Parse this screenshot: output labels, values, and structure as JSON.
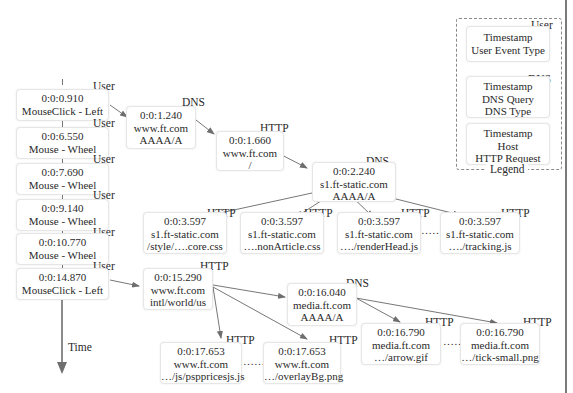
{
  "diagram": {
    "axis_label": "Time",
    "user_events": [
      {
        "tag": "User",
        "timestamp": "0:0:0.910",
        "event": "MouseClick - Left"
      },
      {
        "tag": "User",
        "timestamp": "0:0:6.550",
        "event": "Mouse - Wheel"
      },
      {
        "tag": "User",
        "timestamp": "0:0:7.690",
        "event": "Mouse - Wheel"
      },
      {
        "tag": "User",
        "timestamp": "0:0:9.140",
        "event": "Mouse - Wheel"
      },
      {
        "tag": "User",
        "timestamp": "0:0:10.770",
        "event": "Mouse - Wheel"
      },
      {
        "tag": "User",
        "timestamp": "0:0:14.870",
        "event": "MouseClick - Left"
      }
    ],
    "nodes": {
      "dns1": {
        "tag": "DNS",
        "line1": "0:0:1.240",
        "line2": "www.ft.com",
        "line3": "AAAA/A"
      },
      "http1": {
        "tag": "HTTP",
        "line1": "0:0:1.660",
        "line2": "www.ft.com",
        "line3": "/"
      },
      "dns2": {
        "tag": "DNS",
        "line1": "0:0:2.240",
        "line2": "s1.ft-static.com",
        "line3": "AAAA/A"
      },
      "http_core": {
        "tag": "HTTP",
        "line1": "0:0:3.597",
        "line2": "s1.ft-static.com",
        "line3": "/style/….core.css"
      },
      "http_nonarticle": {
        "tag": "HTTP",
        "line1": "0:0:3.597",
        "line2": "s1.ft-static.com",
        "line3": "….nonArticle.css"
      },
      "http_renderhead": {
        "tag": "HTTP",
        "line1": "0:0:3.597",
        "line2": "s1.ft-static.com",
        "line3": "…./renderHead.js"
      },
      "http_tracking": {
        "tag": "HTTP",
        "line1": "0:0:3.597",
        "line2": "s1.ft-static.com",
        "line3": "…./tracking.js"
      },
      "http_intl": {
        "tag": "HTTP",
        "line1": "0:0:15.290",
        "line2": "www.ft.com",
        "line3": "intl/world/us"
      },
      "dns_media": {
        "tag": "DNS",
        "line1": "0:0:16.040",
        "line2": "media.ft.com",
        "line3": "AAAA/A"
      },
      "http_psp": {
        "tag": "HTTP",
        "line1": "0:0:17.653",
        "line2": "www.ft.com",
        "line3": "…/js/psppricesjs.js"
      },
      "http_overlay": {
        "tag": "HTTP",
        "line1": "0:0:17.653",
        "line2": "www.ft.com",
        "line3": "…/overlayBg.png"
      },
      "http_arrow": {
        "tag": "HTTP",
        "line1": "0:0:16.790",
        "line2": "media.ft.com",
        "line3": "…/arrow.gif"
      },
      "http_tick": {
        "tag": "HTTP",
        "line1": "0:0:16.790",
        "line2": "media.ft.com",
        "line3": "…/tick-small.png"
      }
    },
    "ellipsis": "……",
    "legend": {
      "title": "Legend",
      "items": [
        {
          "tag": "User",
          "lines": [
            "Timestamp",
            "User Event Type"
          ]
        },
        {
          "tag": "DNS",
          "lines": [
            "Timestamp",
            "DNS Query",
            "DNS Type"
          ]
        },
        {
          "tag": "",
          "lines": [
            "Timestamp",
            "Host",
            "HTTP Request"
          ]
        }
      ]
    }
  }
}
